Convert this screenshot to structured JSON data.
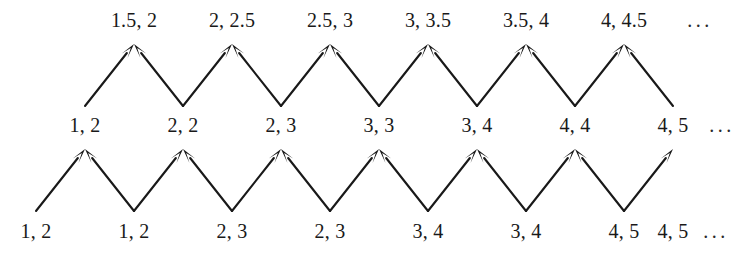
{
  "diagram": {
    "ink_color": "#191919",
    "background_color": "#ffffff",
    "rows": [
      {
        "name": "top-row",
        "y": 20,
        "nodes": [
          {
            "label": "1.5, 2",
            "x": 134
          },
          {
            "label": "2, 2.5",
            "x": 232
          },
          {
            "label": "2.5, 3",
            "x": 330
          },
          {
            "label": "3, 3.5",
            "x": 428
          },
          {
            "label": "3.5, 4",
            "x": 526
          },
          {
            "label": "4, 4.5",
            "x": 624
          }
        ],
        "trailing_ellipsis": {
          "label": "...",
          "x": 700
        }
      },
      {
        "name": "middle-row",
        "y": 125,
        "nodes": [
          {
            "label": "1, 2",
            "x": 85
          },
          {
            "label": "2, 2",
            "x": 183
          },
          {
            "label": "2, 3",
            "x": 281
          },
          {
            "label": "3, 3",
            "x": 379
          },
          {
            "label": "3, 4",
            "x": 477
          },
          {
            "label": "4, 4",
            "x": 575
          },
          {
            "label": "4, 5",
            "x": 673
          }
        ],
        "trailing_ellipsis": {
          "label": "...",
          "x": 722
        }
      },
      {
        "name": "bottom-row",
        "y": 231,
        "nodes": [
          {
            "label": "1, 2",
            "x": 36
          },
          {
            "label": "1, 2",
            "x": 134
          },
          {
            "label": "2, 3",
            "x": 232
          },
          {
            "label": "2, 3",
            "x": 330
          },
          {
            "label": "3, 4",
            "x": 428
          },
          {
            "label": "3, 4",
            "x": 526
          },
          {
            "label": "4, 5",
            "x": 624
          },
          {
            "label": "4, 5",
            "x": 673
          }
        ],
        "trailing_ellipsis": {
          "label": "...",
          "x": 716
        }
      }
    ],
    "arrow_bands": [
      {
        "name": "upper-arrow-band",
        "from_row": "middle-row",
        "to_row": "top-row",
        "tail_y": 106,
        "tip_y": 44,
        "edges": [
          {
            "from_x": 85,
            "to_x": 134
          },
          {
            "from_x": 183,
            "to_x": 134
          },
          {
            "from_x": 183,
            "to_x": 232
          },
          {
            "from_x": 281,
            "to_x": 232
          },
          {
            "from_x": 281,
            "to_x": 330
          },
          {
            "from_x": 379,
            "to_x": 330
          },
          {
            "from_x": 379,
            "to_x": 428
          },
          {
            "from_x": 477,
            "to_x": 428
          },
          {
            "from_x": 477,
            "to_x": 526
          },
          {
            "from_x": 575,
            "to_x": 526
          },
          {
            "from_x": 575,
            "to_x": 624
          },
          {
            "from_x": 673,
            "to_x": 624
          }
        ]
      },
      {
        "name": "lower-arrow-band",
        "from_row": "bottom-row",
        "to_row": "middle-row",
        "tail_y": 211,
        "tip_y": 149,
        "edges": [
          {
            "from_x": 36,
            "to_x": 85
          },
          {
            "from_x": 134,
            "to_x": 85
          },
          {
            "from_x": 134,
            "to_x": 183
          },
          {
            "from_x": 232,
            "to_x": 183
          },
          {
            "from_x": 232,
            "to_x": 281
          },
          {
            "from_x": 330,
            "to_x": 281
          },
          {
            "from_x": 330,
            "to_x": 379
          },
          {
            "from_x": 428,
            "to_x": 379
          },
          {
            "from_x": 428,
            "to_x": 477
          },
          {
            "from_x": 526,
            "to_x": 477
          },
          {
            "from_x": 526,
            "to_x": 575
          },
          {
            "from_x": 624,
            "to_x": 575
          },
          {
            "from_x": 624,
            "to_x": 673
          }
        ]
      }
    ]
  }
}
